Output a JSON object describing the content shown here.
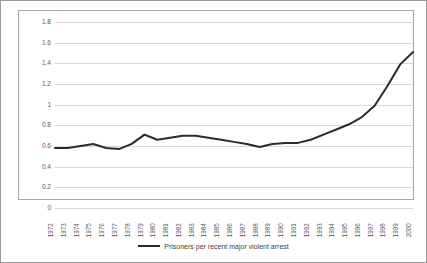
{
  "chart_data": {
    "type": "line",
    "title": "",
    "xlabel": "",
    "ylabel": "",
    "ylim": [
      0,
      1.8
    ],
    "ytick_step": 0.2,
    "grid": true,
    "legend_position": "bottom",
    "line_color": "#2b2b2b",
    "gridline_color": "#d9d9d9",
    "frame_color": "#a6a6a6",
    "ytick_labels": [
      "1.8",
      "1.6",
      "1.4",
      "1.2",
      "1",
      "0.8",
      "0.6",
      "0.4",
      "0.2",
      "0"
    ],
    "ytick_values": [
      1.8,
      1.6,
      1.4,
      1.2,
      1,
      0.8,
      0.6,
      0.4,
      0.2,
      0
    ],
    "categories": [
      "1972",
      "1973",
      "1974",
      "1975",
      "1976",
      "1977",
      "1978",
      "1979",
      "1980",
      "1981",
      "1982",
      "1983",
      "1984",
      "1985",
      "1986",
      "1987",
      "1988",
      "1989",
      "1990",
      "1991",
      "1992",
      "1993",
      "1994",
      "1995",
      "1996",
      "1997",
      "1998",
      "1999",
      "2000"
    ],
    "series": [
      {
        "name": "Prisoners per recent major violent arrest",
        "values": [
          0.58,
          0.58,
          0.6,
          0.62,
          0.58,
          0.57,
          0.62,
          0.71,
          0.66,
          0.68,
          0.7,
          0.7,
          0.68,
          0.66,
          0.64,
          0.62,
          0.59,
          0.62,
          0.63,
          0.63,
          0.66,
          0.71,
          0.76,
          0.81,
          0.88,
          0.99,
          1.18,
          1.39,
          1.51
        ]
      }
    ]
  },
  "legend": {
    "swatch_name": "line-swatch",
    "label": "Prisoners per recent major violent arrest"
  }
}
